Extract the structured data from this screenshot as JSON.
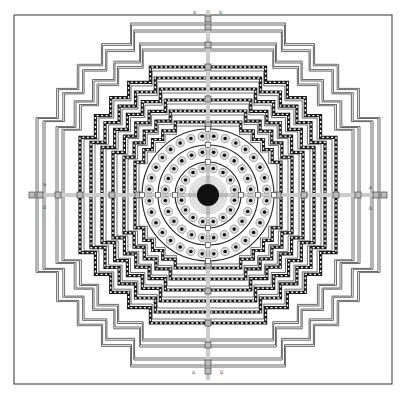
{
  "figure": {
    "kind": "architectural-ground-plan",
    "frame": {
      "x": 14,
      "y": 15,
      "w": 378,
      "h": 369
    },
    "center": {
      "x": 208,
      "y": 195
    },
    "stroke_color": "#333333",
    "fill_dark": "#111111"
  },
  "labels": {
    "north_left": "a",
    "north_right": "b",
    "south_left": "a",
    "south_right": "b",
    "west_top": "a",
    "west_bottom": "b",
    "east_top": "a",
    "east_bottom": "b"
  },
  "terraces": {
    "outer_stepped_lines": [
      172,
      165,
      152,
      146
    ],
    "gallery_squares": [
      128,
      117,
      106,
      95,
      84,
      73
    ],
    "circular_rings": [
      {
        "radius": 66,
        "stupas": 32,
        "stupa_ring_radius": 59
      },
      {
        "radius": 50,
        "stupas": 24,
        "stupa_ring_radius": 43
      },
      {
        "radius": 33,
        "stupas": 16,
        "stupa_ring_radius": 27
      }
    ],
    "central_stupa_radius": 11,
    "central_halo_radius": 19
  }
}
